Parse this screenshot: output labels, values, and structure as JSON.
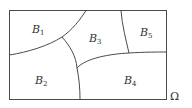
{
  "diagram": {
    "universe_label": "Ω",
    "regions": [
      {
        "id": "B1",
        "letter": "B",
        "subscript": "1"
      },
      {
        "id": "B2",
        "letter": "B",
        "subscript": "2"
      },
      {
        "id": "B3",
        "letter": "B",
        "subscript": "3"
      },
      {
        "id": "B4",
        "letter": "B",
        "subscript": "4"
      },
      {
        "id": "B5",
        "letter": "B",
        "subscript": "5"
      }
    ],
    "colors": {
      "stroke": "#4a4a4a",
      "text": "#333333",
      "background": "#ffffff"
    }
  }
}
